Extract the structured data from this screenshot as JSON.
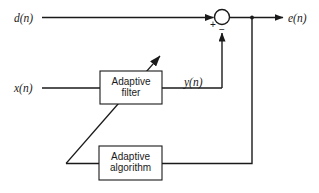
{
  "diagram": {
    "background_color": "#ffffff",
    "line_color": "#1a1a1a",
    "signals": {
      "desired": "d(n)",
      "input": "x(n)",
      "filter_output": "y(n)",
      "error": "e(n)"
    },
    "summing_junction": {
      "name": "summing-junction",
      "plus_sign": "+",
      "minus_sign": "−",
      "cx": 222,
      "cy": 17,
      "r": 7.5
    },
    "blocks": [
      {
        "id": "adaptive-filter",
        "line1": "Adaptive",
        "line2": "filter",
        "x": 100,
        "y": 71,
        "width": 62,
        "height": 33
      },
      {
        "id": "adaptive-algorithm",
        "line1": "Adaptive",
        "line2": "algorithm",
        "x": 99,
        "y": 146,
        "width": 63,
        "height": 34
      }
    ],
    "connections": [
      {
        "id": "d-to-sum",
        "from": "d(n)",
        "to": "summing-junction"
      },
      {
        "id": "x-to-filter",
        "from": "x(n)",
        "to": "adaptive-filter"
      },
      {
        "id": "filter-to-sum",
        "from": "adaptive-filter",
        "to": "summing-junction",
        "label": "y(n)"
      },
      {
        "id": "sum-to-error",
        "from": "summing-junction",
        "to": "e(n)"
      },
      {
        "id": "error-tap-to-algorithm",
        "from": "e(n)",
        "to": "adaptive-algorithm"
      },
      {
        "id": "algorithm-to-filter",
        "from": "adaptive-algorithm",
        "to": "adaptive-filter"
      }
    ]
  }
}
